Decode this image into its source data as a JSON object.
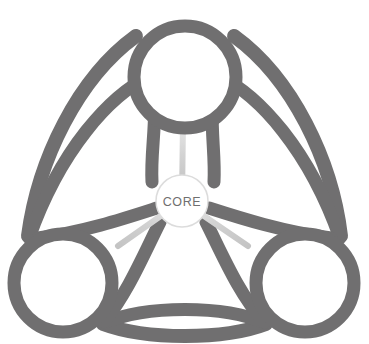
{
  "diagram": {
    "title": "Hub and spoke triquetra diagram",
    "colors": {
      "stroke": "#706f70",
      "stroke_light": "#6e6d6e",
      "spoke": "#cfcfcf",
      "spoke_highlight": "#e8e8e8",
      "background": "#ffffff",
      "core_fill": "#ffffff",
      "core_stroke": "#d9d9d9",
      "label_text": "#6f6f6f"
    },
    "core": {
      "label": "CORE",
      "cx": 182,
      "cy": 201,
      "r": 26
    },
    "nodes": [
      {
        "id": "node-top",
        "label": "",
        "cx": 185,
        "cy": 77,
        "r": 57
      },
      {
        "id": "node-bottom-left",
        "label": "",
        "cx": 63,
        "cy": 283,
        "r": 55
      },
      {
        "id": "node-bottom-right",
        "label": "",
        "cx": 305,
        "cy": 283,
        "r": 55
      }
    ],
    "spokes": [
      {
        "id": "spoke-core-to-top",
        "from": "core",
        "to": "node-top"
      },
      {
        "id": "spoke-core-to-bottom-left",
        "from": "core",
        "to": "node-bottom-left"
      },
      {
        "id": "spoke-core-to-bottom-right",
        "from": "core",
        "to": "node-bottom-right"
      }
    ],
    "arcs": {
      "outer_count": 3,
      "inner_count": 3,
      "stroke_width_outer": 14,
      "stroke_width_inner": 13
    }
  }
}
